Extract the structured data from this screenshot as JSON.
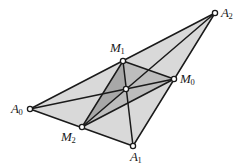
{
  "figure": {
    "background_color": "#ffffff",
    "stroke_color": "#1a1a1a",
    "outer_fill": "#d9d9d9",
    "medial_fill": "#bdbdbd",
    "inner_fill": "#a8a8a8",
    "node_fill": "#ffffff",
    "node_stroke": "#1a1a1a"
  },
  "points": {
    "A0": {
      "label": "A",
      "sub": "0",
      "x": 30,
      "y": 109,
      "label_x": 11,
      "label_y": 102
    },
    "A1": {
      "label": "A",
      "sub": "1",
      "x": 133,
      "y": 146,
      "label_x": 130,
      "label_y": 150
    },
    "A2": {
      "label": "A",
      "sub": "2",
      "x": 215,
      "y": 13,
      "label_x": 221,
      "label_y": 6
    },
    "M0": {
      "label": "M",
      "sub": "0",
      "x": 174,
      "y": 79,
      "label_x": 180,
      "label_y": 72
    },
    "M1": {
      "label": "M",
      "sub": "1",
      "x": 123,
      "y": 61,
      "label_x": 110,
      "label_y": 41
    },
    "M2": {
      "label": "M",
      "sub": "2",
      "x": 82,
      "y": 127,
      "label_x": 61,
      "label_y": 130
    },
    "G": {
      "label": "",
      "sub": "",
      "x": 126,
      "y": 89,
      "label_x": 0,
      "label_y": 0
    }
  },
  "polygons": {
    "outer_triangle": "30,109 215,13 133,146",
    "medial_triangle": "174,79 123,61 82,127",
    "inner_shaded": "123,61 126,89 82,127"
  },
  "segments": {
    "side_A0_A2": "30,109 215,13",
    "side_A2_A1": "215,13 133,146",
    "side_A1_A0": "133,146 30,109",
    "median_A0_M0": "30,109 174,79",
    "median_A1_M1": "133,146 123,61",
    "median_A2_M2": "215,13 82,127",
    "medial_M1_M0": "123,61 174,79",
    "medial_M0_M2": "174,79 82,127",
    "medial_M2_M1": "82,127 123,61"
  },
  "chart_data": {
    "type": "diagram",
    "vertices": [
      {
        "name": "A0",
        "x": 30,
        "y": 109
      },
      {
        "name": "A1",
        "x": 133,
        "y": 146
      },
      {
        "name": "A2",
        "x": 215,
        "y": 13
      }
    ],
    "midpoints": [
      {
        "name": "M0",
        "x": 174,
        "y": 79,
        "of": "A1A2"
      },
      {
        "name": "M1",
        "x": 123,
        "y": 61,
        "of": "A0A2"
      },
      {
        "name": "M2",
        "x": 82,
        "y": 127,
        "of": "A0A1"
      }
    ],
    "centroid": {
      "name": "G",
      "x": 126,
      "y": 89
    }
  }
}
